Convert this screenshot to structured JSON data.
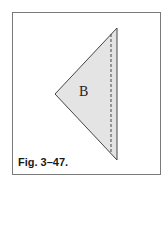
{
  "figure": {
    "caption": "Fig. 3–47.",
    "shape_label": "B",
    "colors": {
      "fill": "#e4e4e4",
      "stroke": "#444444",
      "frame": "#7a7a7a"
    }
  }
}
